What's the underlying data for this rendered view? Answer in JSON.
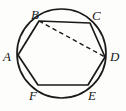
{
  "figure": {
    "stroke_color": "#1a1a1a",
    "background_color": "#fdfdfb",
    "circle": {
      "center_x": 61.5,
      "center_y": 53.5,
      "radius": 44.5
    },
    "hexagon": {
      "vertices": [
        {
          "label": "A",
          "x": 18.0,
          "y": 55.0
        },
        {
          "label": "B",
          "x": 39.0,
          "y": 21.0
        },
        {
          "label": "C",
          "x": 90.0,
          "y": 23.0
        },
        {
          "label": "D",
          "x": 105.0,
          "y": 57.0
        },
        {
          "label": "E",
          "x": 88.0,
          "y": 85.0
        },
        {
          "label": "F",
          "x": 38.0,
          "y": 85.0
        }
      ]
    },
    "dashed_diagonal": {
      "name": "B-to-D",
      "from": "B",
      "to": "D",
      "from_x": 39.0,
      "from_y": 21.0,
      "to_x": 105.0,
      "to_y": 57.0
    },
    "labels": [
      {
        "text": "B",
        "x": 31,
        "y": 8
      },
      {
        "text": "C",
        "x": 92,
        "y": 9
      },
      {
        "text": "A",
        "x": 3,
        "y": 50
      },
      {
        "text": "D",
        "x": 110,
        "y": 50
      },
      {
        "text": "F",
        "x": 29,
        "y": 89
      },
      {
        "text": "E",
        "x": 88,
        "y": 89
      }
    ]
  }
}
